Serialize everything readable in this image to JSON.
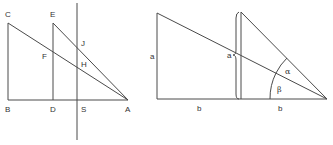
{
  "left_figure": {
    "labels": {
      "C": "C",
      "E": "E",
      "F": "F",
      "J": "J",
      "H": "H",
      "B": "B",
      "D": "D",
      "S": "S",
      "A": "A"
    }
  },
  "right_figure": {
    "labels": {
      "left_side": "a",
      "brace": "a",
      "alpha": "α",
      "beta": "β",
      "base_left": "b",
      "base_right": "b"
    }
  },
  "colors": {
    "line": "#4a4a4a",
    "text": "#333333",
    "background": "#ffffff"
  }
}
